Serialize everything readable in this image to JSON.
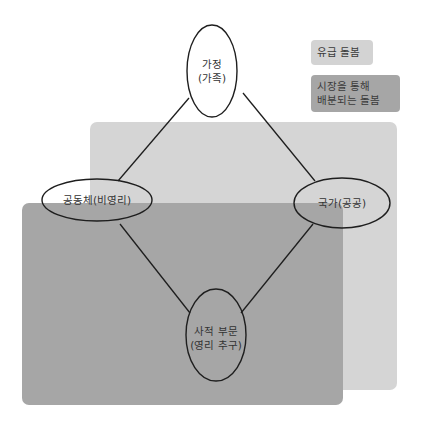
{
  "legend": {
    "items": [
      {
        "label_lines": [
          "유급 돌봄"
        ],
        "color": "#d3d3d3"
      },
      {
        "label_lines": [
          "시장을 통해",
          "배분되는 돌봄"
        ],
        "color": "#a6a6a6"
      }
    ]
  },
  "regions": {
    "paid_care": {
      "color": "#d5d5d5"
    },
    "market_care": {
      "color": "#a6a6a6"
    }
  },
  "nodes": {
    "family": {
      "lines": [
        "가정",
        "(가족)"
      ]
    },
    "community": {
      "lines": [
        "공동체(비영리)"
      ]
    },
    "state": {
      "lines": [
        "국가(공공)"
      ]
    },
    "private": {
      "lines": [
        "사적 부문",
        "(영리 추구)"
      ]
    }
  },
  "edges": [
    {
      "from": "family",
      "to": "community"
    },
    {
      "from": "family",
      "to": "state"
    },
    {
      "from": "community",
      "to": "private"
    },
    {
      "from": "state",
      "to": "private"
    }
  ]
}
